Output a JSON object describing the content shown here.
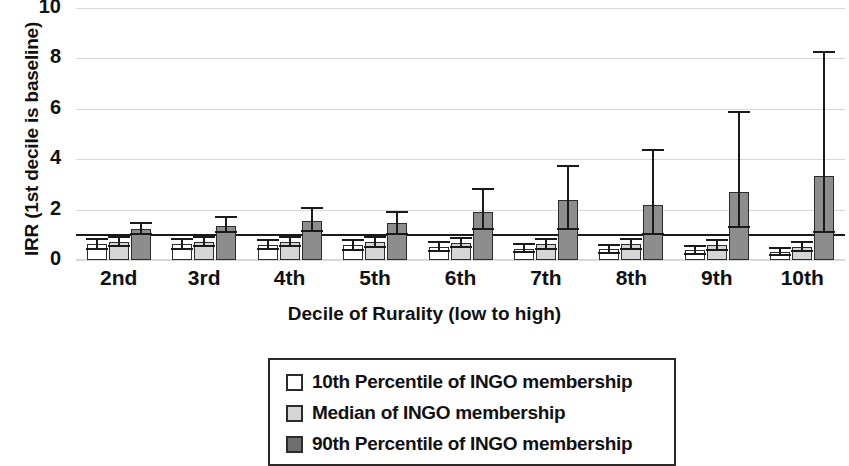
{
  "chart_data": {
    "type": "bar",
    "title": "",
    "xlabel": "Decile of Rurality (low to high)",
    "ylabel": "IRR (1st decile is baseline)",
    "categories": [
      "2nd",
      "3rd",
      "4th",
      "5th",
      "6th",
      "7th",
      "8th",
      "9th",
      "10th"
    ],
    "ylim": [
      0,
      10
    ],
    "yticks": [
      0,
      2,
      4,
      6,
      8,
      10
    ],
    "ytick_labels": [
      "0",
      "2",
      "4",
      "6",
      "8",
      "10"
    ],
    "grid": true,
    "grid_axis": "y",
    "baseline": 1.0,
    "legend_position": "below",
    "series": [
      {
        "name": "10th Percentile of INGO membership",
        "color": "#ffffff",
        "values": [
          0.62,
          0.62,
          0.6,
          0.58,
          0.52,
          0.45,
          0.42,
          0.38,
          0.32
        ],
        "err_low": [
          0.45,
          0.45,
          0.42,
          0.4,
          0.35,
          0.3,
          0.28,
          0.25,
          0.2
        ],
        "err_high": [
          0.82,
          0.82,
          0.8,
          0.78,
          0.72,
          0.65,
          0.6,
          0.55,
          0.48
        ]
      },
      {
        "name": "Median of INGO membership",
        "color": "#d5d5d5",
        "values": [
          0.72,
          0.72,
          0.72,
          0.7,
          0.68,
          0.62,
          0.62,
          0.58,
          0.52
        ],
        "err_low": [
          0.55,
          0.55,
          0.55,
          0.52,
          0.5,
          0.45,
          0.44,
          0.4,
          0.35
        ],
        "err_high": [
          0.92,
          0.92,
          0.92,
          0.9,
          0.88,
          0.82,
          0.85,
          0.8,
          0.72
        ]
      },
      {
        "name": "90th Percentile of INGO membership",
        "color": "#8d8d8d",
        "values": [
          1.25,
          1.35,
          1.55,
          1.45,
          1.9,
          2.4,
          2.2,
          2.7,
          3.35
        ],
        "err_low": [
          1.05,
          1.1,
          1.15,
          1.05,
          1.25,
          1.25,
          1.05,
          1.3,
          1.1
        ],
        "err_high": [
          1.48,
          1.72,
          2.08,
          1.92,
          2.8,
          3.72,
          4.38,
          5.88,
          8.25
        ]
      }
    ]
  },
  "legend": {
    "items": [
      {
        "label": "10th Percentile of INGO membership",
        "swatch": "legend-swatch-white"
      },
      {
        "label": "Median of INGO membership",
        "swatch": "legend-swatch-light-gray"
      },
      {
        "label": "90th Percentile of INGO membership",
        "swatch": "legend-swatch-dark-gray"
      }
    ]
  }
}
